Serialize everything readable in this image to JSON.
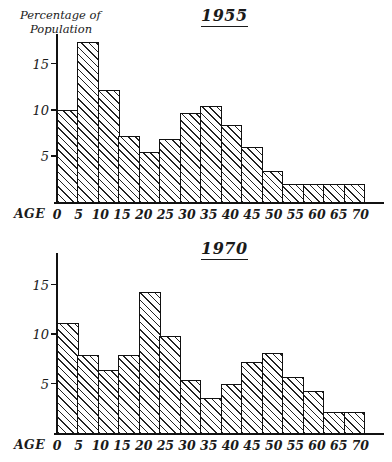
{
  "figure": {
    "axis_y_label_line1": "Percentage of",
    "axis_y_label_line2": "Population",
    "axis_x_label": "AGE",
    "ink_color": "#111111"
  },
  "charts": [
    {
      "id": "chart-1955",
      "title": "1955"
    },
    {
      "id": "chart-1970",
      "title": "1970"
    }
  ],
  "chart_data": [
    {
      "type": "bar",
      "title": "1955",
      "xlabel": "AGE",
      "ylabel": "Percentage of Population",
      "grid": false,
      "legend": null,
      "xlim": [
        0,
        75
      ],
      "ylim": [
        0,
        18
      ],
      "ytick_labels": [
        "5",
        "10",
        "15"
      ],
      "yticks": [
        5,
        10,
        15
      ],
      "xtick_labels": [
        "0",
        "5",
        "10",
        "15",
        "20",
        "25",
        "30",
        "35",
        "40",
        "45",
        "50",
        "55",
        "60",
        "65",
        "70"
      ],
      "xticks": [
        0,
        5,
        10,
        15,
        20,
        25,
        30,
        35,
        40,
        45,
        50,
        55,
        60,
        65,
        70
      ],
      "bin_width": 5,
      "categories": [
        "0-5",
        "5-10",
        "10-15",
        "15-20",
        "20-25",
        "25-30",
        "30-35",
        "35-40",
        "40-45",
        "45-50",
        "50-55",
        "55-60",
        "60-65",
        "65-70",
        "70-75"
      ],
      "values": [
        10.0,
        17.4,
        12.2,
        7.2,
        5.4,
        6.8,
        9.6,
        10.4,
        8.4,
        6.0,
        3.4,
        2.0,
        2.0,
        2.0,
        2.0
      ]
    },
    {
      "type": "bar",
      "title": "1970",
      "xlabel": "AGE",
      "ylabel": "Percentage of Population",
      "grid": false,
      "legend": null,
      "xlim": [
        0,
        75
      ],
      "ylim": [
        0,
        18
      ],
      "ytick_labels": [
        "5",
        "10",
        "15"
      ],
      "yticks": [
        5,
        10,
        15
      ],
      "xtick_labels": [
        "0",
        "5",
        "10",
        "15",
        "20",
        "25",
        "30",
        "35",
        "40",
        "45",
        "50",
        "55",
        "60",
        "65",
        "70"
      ],
      "xticks": [
        0,
        5,
        10,
        15,
        20,
        25,
        30,
        35,
        40,
        45,
        50,
        55,
        60,
        65,
        70
      ],
      "bin_width": 5,
      "categories": [
        "0-5",
        "5-10",
        "10-15",
        "15-20",
        "20-25",
        "25-30",
        "30-35",
        "35-40",
        "40-45",
        "45-50",
        "50-55",
        "55-60",
        "60-65",
        "65-70",
        "70-75"
      ],
      "values": [
        11.1,
        7.9,
        6.4,
        7.9,
        14.3,
        9.8,
        5.4,
        3.5,
        5.0,
        7.2,
        8.1,
        5.7,
        4.2,
        2.1,
        2.1
      ]
    }
  ]
}
